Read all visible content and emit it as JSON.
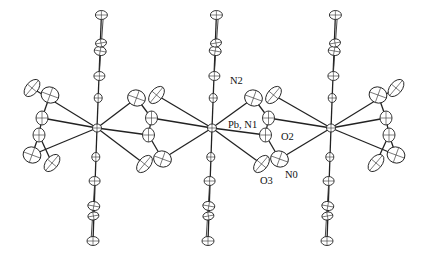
{
  "figure": {
    "type": "ORTEP crystal structure diagram",
    "labels": {
      "metal": "Pb, N1",
      "n2": "N2",
      "o2": "O2",
      "o3": "O3",
      "n0": "N0"
    },
    "metal_centers": [
      {
        "x": 97,
        "y": 128
      },
      {
        "x": 212,
        "y": 128
      },
      {
        "x": 331,
        "y": 128
      }
    ],
    "colors": {
      "line": "#222222",
      "background": "#ffffff"
    }
  }
}
